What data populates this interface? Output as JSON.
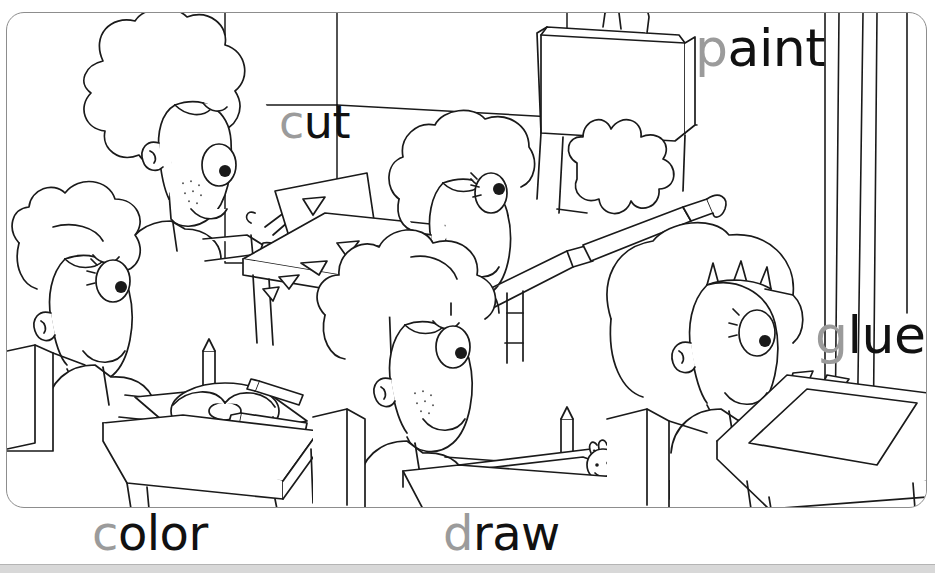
{
  "page": {
    "type": "coloring-worksheet",
    "background_color": "#ffffff",
    "frame_color": "#8d8d8d",
    "bottom_band_color": "#d8d8d8"
  },
  "words": [
    {
      "id": "paint",
      "trace_letter": "p",
      "rest": "aint",
      "full": "paint",
      "trace_color": "#9b9b9b",
      "solid_color": "#111111"
    },
    {
      "id": "cut",
      "trace_letter": "c",
      "rest": "ut",
      "full": "cut",
      "trace_color": "#9b9b9b",
      "solid_color": "#111111"
    },
    {
      "id": "glue",
      "trace_letter": "g",
      "rest": "lue",
      "full": "glue",
      "trace_color": "#9b9b9b",
      "solid_color": "#111111"
    },
    {
      "id": "color",
      "trace_letter": "c",
      "rest": "olor",
      "full": "color",
      "trace_color": "#9b9b9b",
      "solid_color": "#111111"
    },
    {
      "id": "draw",
      "trace_letter": "d",
      "rest": "raw",
      "full": "draw",
      "trace_color": "#9b9b9b",
      "solid_color": "#111111"
    }
  ],
  "illustration": {
    "description": "classroom line-art scene with five children doing art activities",
    "stroke_color": "#1a1a1a",
    "children": [
      {
        "name": "curly-haired-boy-cutting",
        "activity": "cut"
      },
      {
        "name": "girl-painting-at-easel",
        "activity": "paint"
      },
      {
        "name": "girl-coloring-flower",
        "activity": "color"
      },
      {
        "name": "boy-drawing-figure",
        "activity": "draw"
      },
      {
        "name": "girl-gluing-shapes",
        "activity": "glue"
      }
    ]
  }
}
